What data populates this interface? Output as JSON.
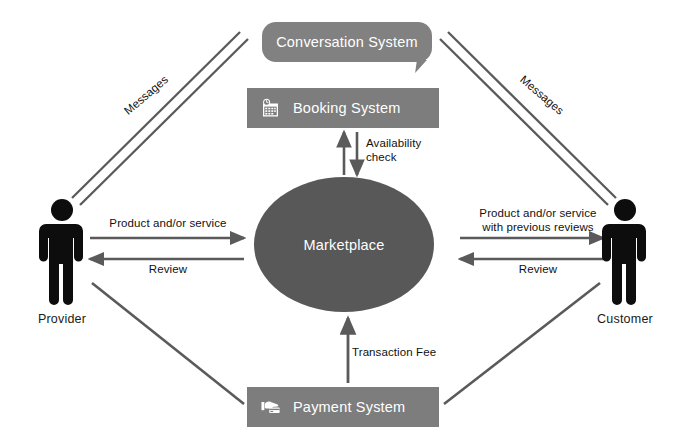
{
  "diagram": {
    "colors": {
      "bubble_fill": "#818181",
      "box_fill": "#7d7d7d",
      "ellipse_fill": "#585858",
      "actor_fill": "#0d0d0d",
      "line_color": "#5a5a5a",
      "label_text": "#111111",
      "node_text": "#ffffff",
      "background": "#ffffff"
    },
    "nodes": {
      "conversation_system": {
        "label": "Conversation System",
        "shape": "speech-bubble"
      },
      "booking_system": {
        "label": "Booking System",
        "shape": "rectangle",
        "icon": "calendar-clock-icon"
      },
      "payment_system": {
        "label": "Payment System",
        "shape": "rectangle",
        "icon": "hand-credit-card-icon"
      },
      "marketplace": {
        "label": "Marketplace",
        "shape": "ellipse"
      },
      "provider": {
        "label": "Provider",
        "shape": "person-icon"
      },
      "customer": {
        "label": "Customer",
        "shape": "person-icon"
      }
    },
    "edges": {
      "provider_to_marketplace": {
        "label": "Product and/or service",
        "direction": "right"
      },
      "marketplace_to_provider": {
        "label": "Review",
        "direction": "left"
      },
      "marketplace_to_customer": {
        "label": "Product and/or service\nwith previous reviews",
        "direction": "right"
      },
      "customer_to_marketplace": {
        "label": "Review",
        "direction": "left"
      },
      "booking_marketplace": {
        "label": "Availability\ncheck",
        "direction": "bidirectional-vertical"
      },
      "payment_to_marketplace": {
        "label": "Transaction Fee",
        "direction": "up"
      },
      "provider_conversation": {
        "label": "Messages",
        "direction": "bidirectional-diagonal"
      },
      "customer_conversation": {
        "label": "Messages",
        "direction": "bidirectional-diagonal"
      },
      "provider_payment": {
        "label": "",
        "direction": "line"
      },
      "payment_customer": {
        "label": "",
        "direction": "line"
      }
    }
  }
}
